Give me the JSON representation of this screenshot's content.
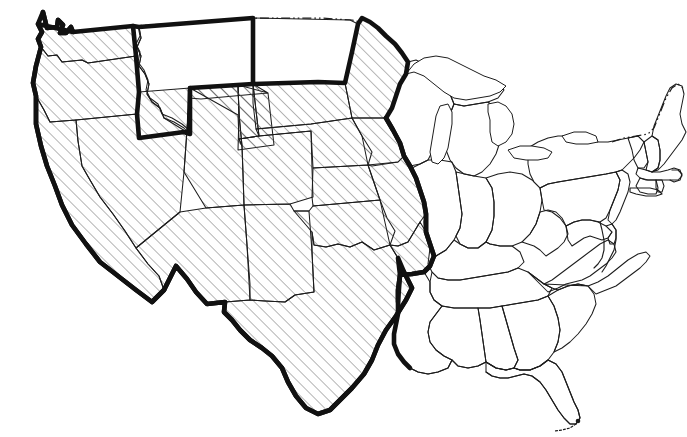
{
  "map": {
    "title": "United States Regional Map",
    "description": "Outline map of the contiguous United States with a western/central region marked by diagonal hatching and enclosed by a heavy boundary line.",
    "background_color": "#ffffff",
    "outline_color": "#1d1d1d",
    "boundary_color": "#111111",
    "hatch_color": "#555555",
    "hatch_angle_degrees": 45,
    "hatch_spacing_px": 8.5,
    "canada_border_style": "dash-dot-dot",
    "legend": {
      "hatched_label": "Hatched region",
      "plain_label": "Unhatched region"
    },
    "regions": {
      "hatched_states": [
        "Washington",
        "Oregon",
        "California",
        "Nevada",
        "Utah",
        "Arizona",
        "Wyoming",
        "Colorado",
        "New Mexico",
        "South Dakota",
        "Nebraska",
        "Kansas",
        "Oklahoma",
        "Texas",
        "Minnesota",
        "Iowa",
        "Missouri",
        "Arkansas"
      ],
      "plain_states": [
        "Idaho",
        "Montana",
        "North Dakota",
        "Wisconsin",
        "Michigan",
        "Illinois",
        "Indiana",
        "Ohio",
        "Kentucky",
        "Tennessee",
        "Louisiana",
        "Mississippi",
        "Alabama",
        "Georgia",
        "Florida",
        "South Carolina",
        "North Carolina",
        "Virginia",
        "West Virginia",
        "Maryland",
        "Delaware",
        "Pennsylvania",
        "New Jersey",
        "New York",
        "Connecticut",
        "Rhode Island",
        "Massachusetts",
        "Vermont",
        "New Hampshire",
        "Maine"
      ]
    },
    "features": {
      "great_lakes": "Great Lakes",
      "mississippi_river_boundary": "Mississippi River",
      "mexico_border": "United States - Mexico border",
      "canada_border": "United States - Canada border",
      "florida_keys": "Florida Keys"
    }
  }
}
